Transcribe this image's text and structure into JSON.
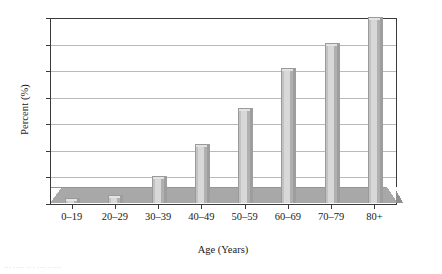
{
  "chart_data": {
    "type": "bar",
    "title": "",
    "xlabel": "Age (Years)",
    "ylabel": "Percent (%)",
    "categories": [
      "0–19",
      "20–29",
      "30–39",
      "40–49",
      "50–59",
      "60–69",
      "70–79",
      "80+"
    ],
    "values": [
      0.1,
      0.4,
      1.8,
      4.2,
      6.9,
      9.9,
      11.8,
      13.8
    ],
    "ylim": [
      0,
      14
    ],
    "ytick_labels": [
      "0",
      "2",
      "4",
      "6",
      "8",
      "10",
      "12",
      "14"
    ],
    "ytick_values": [
      0,
      2,
      4,
      6,
      8,
      10,
      12,
      14
    ],
    "grid": true,
    "legend": false,
    "style": "3d-bar",
    "colors": {
      "bar_face": "#d8d8d8",
      "bar_edge": "#9a9a9a",
      "floor": "#a8a8a8",
      "gridline": "#b9b9b9",
      "axis": "#3a3a3a",
      "background": "#ffffff"
    }
  },
  "caption": {
    "text": "··· ····· ·· · ···· · ····"
  }
}
